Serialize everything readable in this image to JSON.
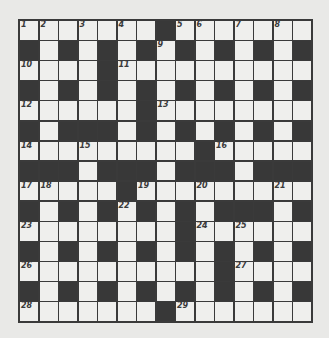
{
  "puzzle": {
    "rows": 15,
    "cols": 15,
    "grid": [
      "WWWWWWWBWWWWWWW",
      "BWBWBWBWBWBWBWB",
      "WWWWBWWWWWWWWWW",
      "BWBWBWBWBWBWBWB",
      "WWWWWWBWWWWWWWW",
      "BWBBBWBWBWBWBWB",
      "WWWWWWWWWBWWWWW",
      "BBBWBBBWBBBWBBB",
      "WWWWWBWWWWWWWWW",
      "BWBWBWBWBWBBBWB",
      "WWWWWWWWBWWWWWW",
      "BWBWBWBWBWBWBWB",
      "WWWWWWWWWWBWWWW",
      "BWBWBWBWBWBWBWB",
      "WWWWWWWBWWWWWWW"
    ],
    "numbers": [
      {
        "n": "1",
        "r": 0,
        "c": 0
      },
      {
        "n": "2",
        "r": 0,
        "c": 1
      },
      {
        "n": "3",
        "r": 0,
        "c": 3
      },
      {
        "n": "4",
        "r": 0,
        "c": 5
      },
      {
        "n": "5",
        "r": 0,
        "c": 8
      },
      {
        "n": "6",
        "r": 0,
        "c": 9
      },
      {
        "n": "7",
        "r": 0,
        "c": 11
      },
      {
        "n": "8",
        "r": 0,
        "c": 13
      },
      {
        "n": "9",
        "r": 1,
        "c": 7
      },
      {
        "n": "10",
        "r": 2,
        "c": 0
      },
      {
        "n": "11",
        "r": 2,
        "c": 5
      },
      {
        "n": "12",
        "r": 4,
        "c": 0
      },
      {
        "n": "13",
        "r": 4,
        "c": 7
      },
      {
        "n": "14",
        "r": 6,
        "c": 0
      },
      {
        "n": "15",
        "r": 6,
        "c": 3
      },
      {
        "n": "16",
        "r": 6,
        "c": 10
      },
      {
        "n": "17",
        "r": 8,
        "c": 0
      },
      {
        "n": "18",
        "r": 8,
        "c": 1
      },
      {
        "n": "19",
        "r": 8,
        "c": 6
      },
      {
        "n": "20",
        "r": 8,
        "c": 9
      },
      {
        "n": "21",
        "r": 8,
        "c": 13
      },
      {
        "n": "22",
        "r": 9,
        "c": 5
      },
      {
        "n": "23",
        "r": 10,
        "c": 0
      },
      {
        "n": "24",
        "r": 10,
        "c": 9
      },
      {
        "n": "25",
        "r": 10,
        "c": 11
      },
      {
        "n": "26",
        "r": 12,
        "c": 0
      },
      {
        "n": "27",
        "r": 12,
        "c": 11
      },
      {
        "n": "28",
        "r": 14,
        "c": 0
      },
      {
        "n": "29",
        "r": 14,
        "c": 8
      }
    ]
  },
  "colors": {
    "background": "#e9e9e7",
    "black_cell": "#383838",
    "white_cell": "#efefed",
    "grid_line": "#3a3a3a"
  }
}
